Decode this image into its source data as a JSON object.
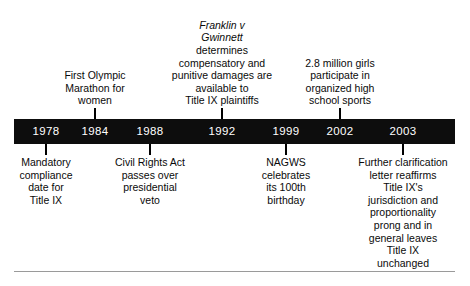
{
  "figure": {
    "name": "title-ix-timeline",
    "bar_color": "#0d0d0d",
    "year_text_color": "#ffffff",
    "caption_text_color": "#0a0a0a",
    "rule_color": "#9a9a9a"
  },
  "timeline": {
    "years": [
      {
        "year": "1978",
        "x": 46,
        "side": "below"
      },
      {
        "year": "1984",
        "x": 95,
        "side": "above"
      },
      {
        "year": "1988",
        "x": 150,
        "side": "below"
      },
      {
        "year": "1992",
        "x": 222,
        "side": "above"
      },
      {
        "year": "1999",
        "x": 286,
        "side": "below"
      },
      {
        "year": "2002",
        "x": 340,
        "side": "above"
      },
      {
        "year": "2003",
        "x": 403,
        "side": "below"
      }
    ],
    "events": [
      {
        "year": "1978",
        "side": "below",
        "x": 46,
        "width": 96,
        "lines": [
          "Mandatory",
          "compliance",
          "date for",
          "Title IX"
        ],
        "italic_lines": 0
      },
      {
        "year": "1984",
        "side": "above",
        "x": 95,
        "width": 100,
        "lines": [
          "First Olympic",
          "Marathon for",
          "women"
        ],
        "italic_lines": 0
      },
      {
        "year": "1988",
        "side": "below",
        "x": 150,
        "width": 112,
        "lines": [
          "Civil Rights Act",
          "passes over",
          "presidential",
          "veto"
        ],
        "italic_lines": 0
      },
      {
        "year": "1992",
        "side": "above",
        "x": 222,
        "width": 126,
        "lines": [
          "Franklin v",
          "Gwinnett",
          "determines",
          "compensatory and",
          "punitive damages are",
          "available to",
          "Title IX plaintiffs"
        ],
        "italic_lines": 2
      },
      {
        "year": "1999",
        "side": "below",
        "x": 286,
        "width": 96,
        "lines": [
          "NAGWS",
          "celebrates",
          "its 100th",
          "birthday"
        ],
        "italic_lines": 0
      },
      {
        "year": "2002",
        "side": "above",
        "x": 340,
        "width": 110,
        "lines": [
          "2.8 million girls",
          "participate in",
          "organized high",
          "school sports"
        ],
        "italic_lines": 0
      },
      {
        "year": "2003",
        "side": "below",
        "x": 403,
        "width": 132,
        "lines": [
          "Further clarification",
          "letter reaffirms",
          "Title IX's",
          "jurisdiction and",
          "proportionality",
          "prong and in",
          "general leaves",
          "Title IX",
          "unchanged"
        ],
        "italic_lines": 0
      }
    ]
  }
}
